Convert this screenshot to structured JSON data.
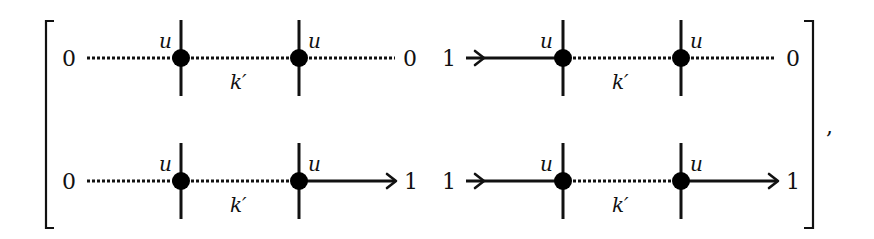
{
  "matrix": {
    "delimiter_left": "[",
    "delimiter_right": "]",
    "trailing_punctuation": ",",
    "cells": [
      {
        "row": 0,
        "col": 0,
        "left_label": "0",
        "right_label": "0",
        "vertex_labels": [
          "u",
          "u"
        ],
        "middle_label": "k′",
        "segments": [
          "dotted",
          "dotted",
          "dotted"
        ],
        "left_arrow": false,
        "right_arrow": false
      },
      {
        "row": 0,
        "col": 1,
        "left_label": "1",
        "right_label": "0",
        "vertex_labels": [
          "u",
          "u"
        ],
        "middle_label": "k′",
        "segments": [
          "solid",
          "dotted",
          "dotted"
        ],
        "left_arrow": true,
        "right_arrow": false
      },
      {
        "row": 1,
        "col": 0,
        "left_label": "0",
        "right_label": "1",
        "vertex_labels": [
          "u",
          "u"
        ],
        "middle_label": "k′",
        "segments": [
          "dotted",
          "dotted",
          "solid"
        ],
        "left_arrow": false,
        "right_arrow": true
      },
      {
        "row": 1,
        "col": 1,
        "left_label": "1",
        "right_label": "1",
        "vertex_labels": [
          "u",
          "u"
        ],
        "middle_label": "k′",
        "segments": [
          "solid",
          "dotted",
          "solid"
        ],
        "left_arrow": true,
        "right_arrow": true
      }
    ]
  }
}
